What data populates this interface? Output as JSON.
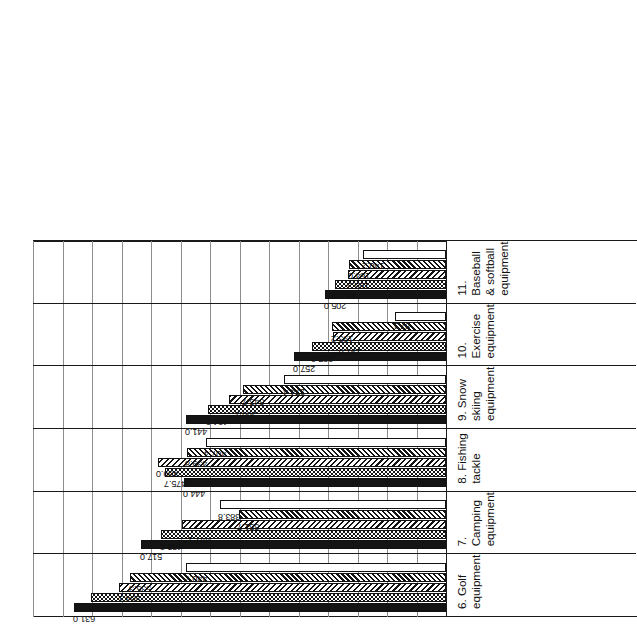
{
  "chart_data": {
    "type": "bar",
    "title": "",
    "subtitle": "",
    "xlabel": "",
    "ylabel": "",
    "orientation": "rotated-90-ccw",
    "grid": true,
    "legend_position": "none",
    "ylim": [
      0,
      700
    ],
    "y_gridline_step": 50,
    "value_note": "** marks estimated / footnoted values",
    "categories": [
      "6. Golf equipment",
      "7. Camping equipment",
      "8. Fishing tackle",
      "9. Snow skiing equipment",
      "10.  Exercise equipment",
      "11. Baseball & softball\nequipment"
    ],
    "series": [
      {
        "name": "series-1",
        "pattern": "solid-black",
        "values": [
          631.0,
          517.0,
          444.0,
          441.0,
          257.0,
          205.0
        ],
        "labels": [
          "631.0",
          "517.0",
          "444.0",
          "441.0",
          "257.0",
          "205.0"
        ]
      },
      {
        "name": "series-2",
        "pattern": "dotted",
        "values": [
          600.9,
          483.2,
          475.7,
          404.2,
          227.0,
          187.6
        ],
        "labels": [
          "600.9",
          "483.2",
          "475.7",
          "404.2",
          "227.0",
          "187.6"
        ]
      },
      {
        "name": "series-3",
        "pattern": "diagonal-hatch-right",
        "values": [
          554.1,
          447.1,
          489.0,
          368.1,
          191.8,
          165.3
        ],
        "labels": [
          "554.1",
          "447.1**",
          "489.0",
          "368.1**",
          "191.8**",
          "165.3"
        ]
      },
      {
        "name": "series-4",
        "pattern": "diagonal-hatch-left",
        "values": [
          535.3,
          351.7,
          439.8,
          343.7,
          193.2,
          164.0
        ],
        "labels": [
          "535.3",
          "351.7",
          "439.8",
          "343.7",
          "193.2",
          "164.0"
        ]
      },
      {
        "name": "series-5",
        "pattern": "empty-white",
        "values": [
          440.7,
          383.8,
          407.4,
          274.4,
          87.1,
          140.2
        ],
        "labels": [
          "440.7",
          "383.8",
          "407.4",
          "274.4",
          "87.1",
          "140.2"
        ]
      }
    ]
  }
}
